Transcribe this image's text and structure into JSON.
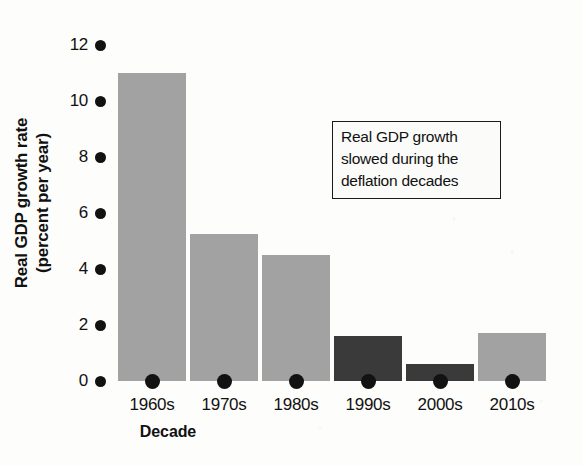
{
  "chart_data": {
    "type": "bar",
    "title": "",
    "xlabel": "Decade",
    "ylabel": "Real GDP growth rate (percent per year)",
    "categories": [
      "1960s",
      "1970s",
      "1980s",
      "1990s",
      "2000s",
      "2010s"
    ],
    "values": [
      11.0,
      5.25,
      4.5,
      1.6,
      0.6,
      1.7
    ],
    "series": [
      {
        "name": "Real GDP growth rate",
        "values": [
          11.0,
          5.25,
          4.5,
          1.6,
          0.6,
          1.7
        ]
      }
    ],
    "bar_colors": [
      "#a2a2a2",
      "#a2a2a2",
      "#a2a2a2",
      "#3a3a3a",
      "#3a3a3a",
      "#a2a2a2"
    ],
    "ylim": [
      0,
      12
    ],
    "yticks": [
      0,
      2,
      4,
      6,
      8,
      10,
      12
    ],
    "ytick_labels": [
      "0",
      "2",
      "4",
      "6",
      "8",
      "10",
      "12"
    ],
    "grid": false,
    "legend": false,
    "annotations": [
      {
        "id": "callout",
        "line1": "Real GDP growth",
        "line2": "slowed during the",
        "line3": "deflation decades"
      }
    ],
    "colors": {
      "light_bar": "#a2a2a2",
      "dark_bar": "#3a3a3a",
      "marker": "#121212",
      "text": "#111111",
      "background": "#fdfdfb"
    }
  }
}
